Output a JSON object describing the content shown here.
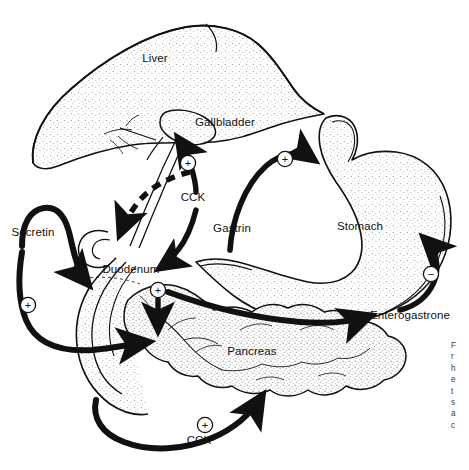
{
  "figure": {
    "width": 469,
    "height": 470,
    "background_color": "#ffffff",
    "ink_color": "#111111"
  },
  "organs": [
    {
      "id": "liver",
      "label": "Liver",
      "x": 155,
      "y": 62
    },
    {
      "id": "gallbladder",
      "label": "Gallbladder",
      "x": 225,
      "y": 126
    },
    {
      "id": "stomach",
      "label": "Stomach",
      "x": 360,
      "y": 230
    },
    {
      "id": "duodenum",
      "label": "Duodenum",
      "x": 131,
      "y": 273
    },
    {
      "id": "pancreas",
      "label": "Pancreas",
      "x": 252,
      "y": 355
    }
  ],
  "hormones": [
    {
      "id": "cck-gallbladder",
      "label": "CCK",
      "x": 193,
      "y": 201,
      "sign": "+",
      "target": "gallbladder",
      "arrow_style": "solid"
    },
    {
      "id": "cck-bileduct",
      "label": "CCK",
      "x": 193,
      "y": 201,
      "sign": "",
      "target": "bile-duct",
      "arrow_style": "dashed"
    },
    {
      "id": "gastrin",
      "label": "Gastrin",
      "x": 232,
      "y": 232,
      "sign": "+",
      "target": "stomach",
      "arrow_style": "solid"
    },
    {
      "id": "secretin",
      "label": "Secretin",
      "x": 33,
      "y": 236,
      "sign": "+",
      "target": "pancreas",
      "arrow_style": "solid"
    },
    {
      "id": "enterogastrone",
      "label": "Enterogastrone",
      "x": 410,
      "y": 319,
      "sign": "-",
      "target": "stomach",
      "arrow_style": "solid"
    },
    {
      "id": "cck-pancreas",
      "label": "CCK",
      "x": 199,
      "y": 444,
      "sign": "+",
      "target": "pancreas",
      "arrow_style": "solid"
    }
  ],
  "signs": [
    {
      "id": "sign-gallbladder",
      "glyph": "+",
      "x": 188,
      "y": 163
    },
    {
      "id": "sign-gastrin",
      "glyph": "+",
      "x": 285,
      "y": 159
    },
    {
      "id": "sign-secretin",
      "glyph": "+",
      "x": 28,
      "y": 305
    },
    {
      "id": "sign-duodenum",
      "glyph": "+",
      "x": 158,
      "y": 290
    },
    {
      "id": "sign-enterogastrone",
      "glyph": "−",
      "x": 431,
      "y": 274
    },
    {
      "id": "sign-cck-bottom",
      "glyph": "+",
      "x": 205,
      "y": 425
    }
  ],
  "caption_fragment": {
    "lines": [
      "F",
      "r",
      "h",
      "e",
      "t",
      "s",
      "a",
      "c"
    ]
  }
}
